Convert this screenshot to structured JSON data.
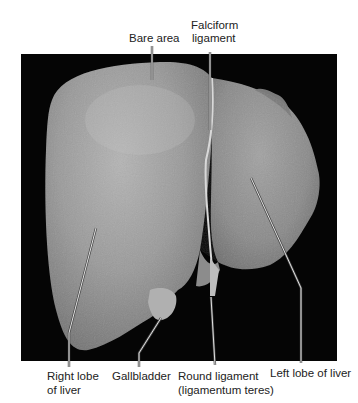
{
  "figure": {
    "background_color": "#ffffff",
    "photo_background_color": "#050505",
    "labels": {
      "bare_area": "Bare area",
      "falciform_line1": "Falciform",
      "falciform_line2": "ligament",
      "right_lobe_line1": "Right lobe",
      "right_lobe_line2": "of liver",
      "gallbladder": "Gallbladder",
      "round_ligament_line1": "Round ligament",
      "round_ligament_line2": "(ligamentum teres)",
      "left_lobe": "Left lobe of liver"
    }
  }
}
